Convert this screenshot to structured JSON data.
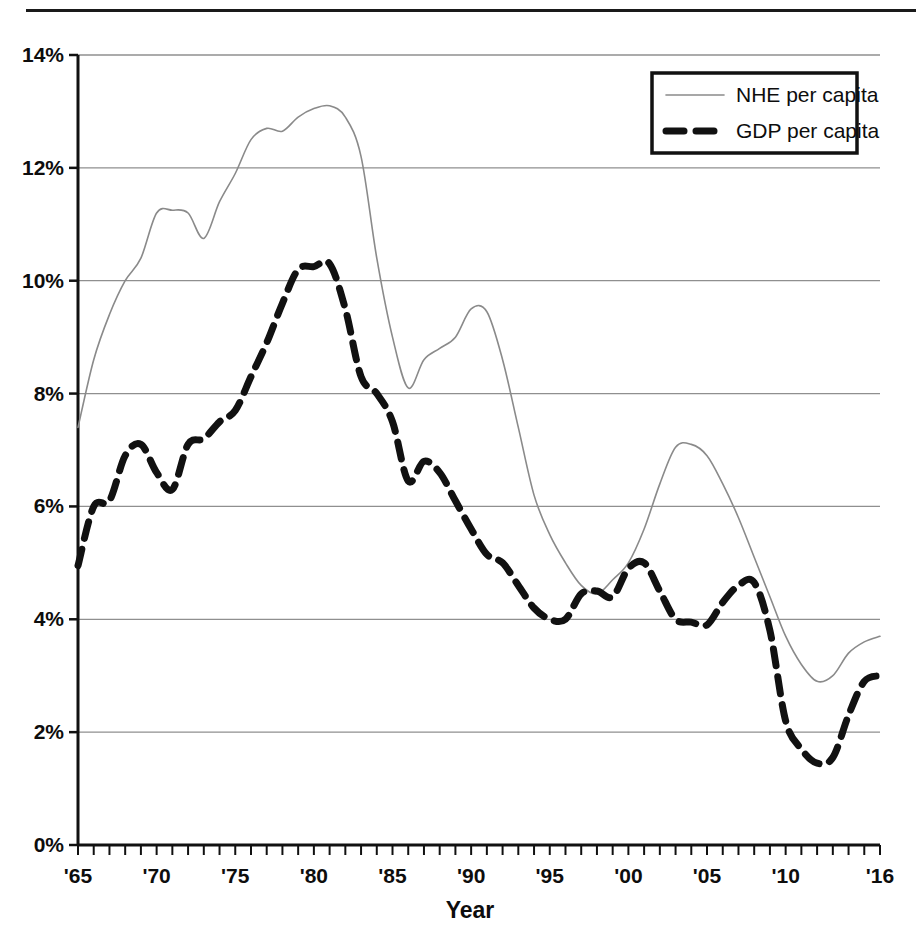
{
  "figure": {
    "has_top_rule": true,
    "background": "#ffffff"
  },
  "chart_data": {
    "type": "line",
    "title": "",
    "subtitle": "",
    "xlabel": "Year",
    "ylabel": "",
    "xlim": [
      1965,
      2016
    ],
    "ylim": [
      0,
      14
    ],
    "grid": "horizontal",
    "y_tick_labels": [
      "0%",
      "2%",
      "4%",
      "6%",
      "8%",
      "10%",
      "12%",
      "14%"
    ],
    "y_tick_values": [
      0,
      2,
      4,
      6,
      8,
      10,
      12,
      14
    ],
    "x_tick_labels": [
      "'65",
      "'70",
      "'75",
      "'80",
      "'85",
      "'90",
      "'95",
      "'00",
      "'05",
      "'10",
      "'16"
    ],
    "x_tick_values": [
      1965,
      1970,
      1975,
      1980,
      1985,
      1990,
      1995,
      2000,
      2005,
      2010,
      2016
    ],
    "x_minor_tick_step": 1,
    "legend_position": "top-right",
    "x": [
      1965,
      1966,
      1967,
      1968,
      1969,
      1970,
      1971,
      1972,
      1973,
      1974,
      1975,
      1976,
      1977,
      1978,
      1979,
      1980,
      1981,
      1982,
      1983,
      1984,
      1985,
      1986,
      1987,
      1988,
      1989,
      1990,
      1991,
      1992,
      1993,
      1994,
      1995,
      1996,
      1997,
      1998,
      1999,
      2000,
      2001,
      2002,
      2003,
      2004,
      2005,
      2006,
      2007,
      2008,
      2009,
      2010,
      2011,
      2012,
      2013,
      2014,
      2015,
      2016
    ],
    "series": [
      {
        "name": "NHE per capita",
        "color": "#8a8a8a",
        "style": "solid",
        "width": 1.6,
        "values": [
          7.4,
          8.6,
          9.4,
          10.0,
          10.4,
          11.2,
          11.25,
          11.2,
          10.75,
          11.4,
          11.9,
          12.5,
          12.7,
          12.65,
          12.9,
          13.05,
          13.1,
          12.9,
          12.2,
          10.4,
          9.0,
          8.1,
          8.6,
          8.8,
          9.0,
          9.5,
          9.45,
          8.6,
          7.4,
          6.2,
          5.5,
          5.0,
          4.6,
          4.45,
          4.7,
          5.0,
          5.6,
          6.4,
          7.05,
          7.1,
          6.9,
          6.4,
          5.8,
          5.1,
          4.4,
          3.7,
          3.2,
          2.9,
          3.0,
          3.4,
          3.6,
          3.7
        ]
      },
      {
        "name": "GDP per capita",
        "color": "#111111",
        "style": "dashed",
        "width": 7,
        "values": [
          4.95,
          6.0,
          6.1,
          6.9,
          7.1,
          6.6,
          6.3,
          7.1,
          7.2,
          7.5,
          7.7,
          8.3,
          8.9,
          9.6,
          10.2,
          10.25,
          10.3,
          9.5,
          8.3,
          8.0,
          7.5,
          6.45,
          6.8,
          6.6,
          6.1,
          5.6,
          5.15,
          5.0,
          4.6,
          4.2,
          4.0,
          4.0,
          4.45,
          4.5,
          4.4,
          4.9,
          5.0,
          4.5,
          4.0,
          3.95,
          3.9,
          4.3,
          4.6,
          4.65,
          3.8,
          2.2,
          1.7,
          1.45,
          1.55,
          2.3,
          2.9,
          3.0
        ]
      }
    ]
  },
  "legend": {
    "items": [
      {
        "label": "NHE per capita",
        "style": "solid"
      },
      {
        "label": "GDP per capita",
        "style": "dashed"
      }
    ]
  },
  "axis": {
    "x_title": "Year"
  }
}
